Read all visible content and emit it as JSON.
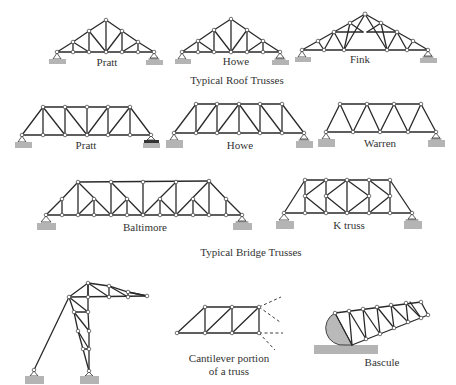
{
  "sections": {
    "roof": {
      "caption": "Typical Roof Trusses",
      "trusses": [
        {
          "name": "Pratt"
        },
        {
          "name": "Howe"
        },
        {
          "name": "Fink"
        }
      ]
    },
    "bridge": {
      "caption": "Typical Bridge Trusses",
      "trusses": [
        {
          "name": "Pratt"
        },
        {
          "name": "Howe"
        },
        {
          "name": "Warren"
        },
        {
          "name": "Baltimore"
        },
        {
          "name": "K truss"
        }
      ]
    },
    "other": {
      "items": [
        {
          "name": ""
        },
        {
          "name_line1": "Cantilever portion",
          "name_line2": "of a truss"
        },
        {
          "name": "Bascule"
        }
      ]
    }
  },
  "colors": {
    "member": "#2a2a2a",
    "support": "#b4b4b4",
    "background": "#ffffff"
  }
}
